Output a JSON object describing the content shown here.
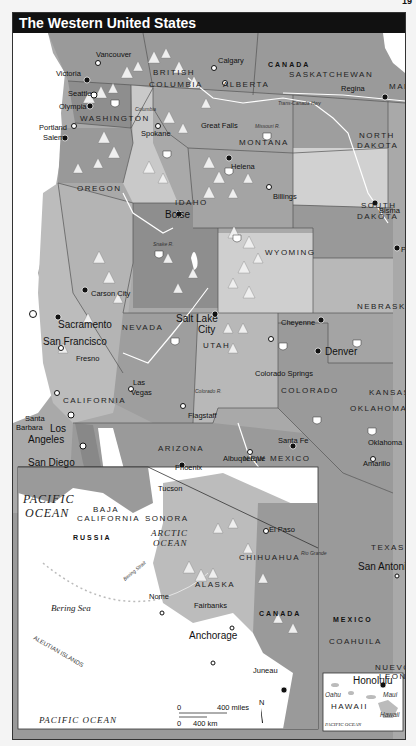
{
  "page_number": "19",
  "title": "The Western United States",
  "colors": {
    "title_bg": "#111111",
    "land_dark": "#8a8a8a",
    "land_mid": "#a9a9a9",
    "land_light": "#c8c8c8",
    "land_pale": "#d9d9d9",
    "water": "#ffffff",
    "mountain": "#eeeeee",
    "border": "#444444"
  },
  "countries": {
    "canada": "CANADA",
    "mexico": "MEXICO",
    "russia": "RUSSIA",
    "canada_inset": "CANADA"
  },
  "provinces": {
    "british_columbia_1": "BRITISH",
    "british_columbia_2": "COLUMBIA",
    "alberta": "ALBERTA",
    "saskatchewan": "SASKATCHEWAN",
    "manitoba": "MANI",
    "baja_1": "BAJA",
    "baja_2": "CALIFORNIA",
    "sonora": "SONORA",
    "chihuahua": "CHIHUAHUA",
    "coahuila": "COAHUILA",
    "nuevo_leon_1": "NUEVO",
    "nuevo_leon_2": "LEON"
  },
  "states": {
    "washington": "WASHINGTON",
    "oregon": "OREGON",
    "idaho": "IDAHO",
    "montana": "MONTANA",
    "north_dakota_1": "NORTH",
    "north_dakota_2": "DAKOTA",
    "south_dakota_1": "SOUTH",
    "south_dakota_2": "DAKOTA",
    "wyoming": "WYOMING",
    "nebraska": "NEBRASKA",
    "nevada": "NEVADA",
    "utah": "UTAH",
    "colorado": "COLORADO",
    "kansas": "KANSAS",
    "california": "CALIFORNIA",
    "arizona": "ARIZONA",
    "new_mexico": "NEW MEXICO",
    "oklahoma": "OKLAHOMA",
    "texas": "TEXAS",
    "alaska": "ALASKA",
    "hawaii": "HAWAII"
  },
  "cities": {
    "vancouver": "Vancouver",
    "victoria": "Victoria",
    "calgary": "Calgary",
    "regina": "Regina",
    "seattle": "Seattle",
    "olympia": "Olympia",
    "spokane": "Spokane",
    "great_falls": "Great Falls",
    "helena": "Helena",
    "billings": "Billings",
    "bismarck": "Bisma",
    "pierre": "Pier",
    "portland": "Portland",
    "salem": "Salem",
    "boise": "Boise",
    "carson_city": "Carson City",
    "sacramento": "Sacramento",
    "san_francisco": "San Francisco",
    "fresno": "Fresno",
    "salt_lake_1": "Salt Lake",
    "salt_lake_2": "City",
    "cheyenne": "Cheyenne",
    "denver": "Denver",
    "colorado_springs": "Colorado Springs",
    "las_vegas_1": "Las",
    "las_vegas_2": "Vegas",
    "santa_barbara_1": "Santa",
    "santa_barbara_2": "Barbara",
    "los_angeles_1": "Los",
    "los_angeles_2": "Angeles",
    "san_diego": "San Diego",
    "flagstaff": "Flagstaff",
    "phoenix": "Phoenix",
    "tucson": "Tucson",
    "santa_fe": "Santa Fe",
    "albuquerque": "Albuquerque",
    "oklahoma_city": "Oklahoma",
    "amarillo": "Amarillo",
    "el_paso": "El Paso",
    "san_antonio": "San Antonio",
    "nome": "Nome",
    "fairbanks": "Fairbanks",
    "anchorage": "Anchorage",
    "juneau": "Juneau",
    "honolulu": "Honolulu",
    "oahu": "Oahu",
    "maui": "Maui",
    "hawaii_island": "Hawaii"
  },
  "water": {
    "pacific_1": "PACIFIC",
    "pacific_2": "OCEAN",
    "arctic_1": "ARCTIC",
    "arctic_2": "OCEAN",
    "bering_sea": "Bering Sea",
    "bering_strait": "Bering Strait",
    "pacific_inset": "PACIFIC   OCEAN",
    "pacific_hawaii": "PACIFIC OCEAN",
    "aleutian": "ALEUTIAN ISLANDS"
  },
  "rivers": {
    "columbia": "Columbia",
    "missouri": "Missouri R.",
    "snake": "Snake R.",
    "colorado": "Colorado R.",
    "rio_grande": "Rio Grande",
    "missouri_east": "Missouri"
  },
  "roads": {
    "trans_canada": "Trans-Canada Hwy",
    "interstates": [
      "5",
      "15",
      "90",
      "94",
      "84",
      "80",
      "25",
      "70",
      "40",
      "10",
      "8",
      "20",
      "35",
      "101",
      "1",
      "19",
      "76",
      "29",
      "43"
    ]
  },
  "scale": {
    "zero_miles": "0",
    "miles": "400 miles",
    "zero_km": "0",
    "km": "400 km"
  },
  "north_arrow": "N"
}
